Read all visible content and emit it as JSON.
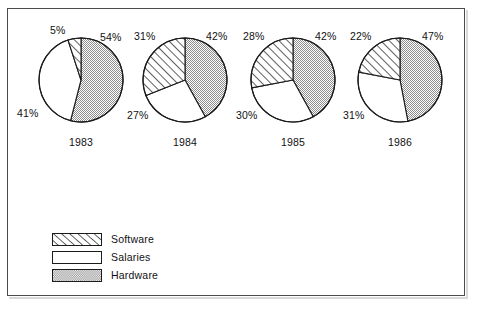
{
  "figure": {
    "background_color": "#ffffff",
    "frame_color": "#4a4a4a"
  },
  "legend": {
    "position": "bottom-left",
    "items": [
      {
        "label": "Software",
        "pattern": "diagonal-hatch",
        "swatch_name": "legend-swatch-software"
      },
      {
        "label": "Salaries",
        "pattern": "solid-white",
        "swatch_name": "legend-swatch-salaries"
      },
      {
        "label": "Hardware",
        "pattern": "stipple-gray",
        "swatch_name": "legend-swatch-hardware"
      }
    ]
  },
  "chart_data": {
    "type": "pie",
    "title": "",
    "subtitle": "",
    "xlabel": "",
    "ylabel": "",
    "legend_position": "bottom-left",
    "grid": false,
    "categories": [
      "Hardware",
      "Salaries",
      "Software"
    ],
    "category_colors": {
      "Hardware": "#c9c9c9",
      "Salaries": "#ffffff",
      "Software": "#ffffff"
    },
    "category_patterns": {
      "Hardware": "stipple-gray",
      "Salaries": "solid-white",
      "Software": "diagonal-hatch"
    },
    "start_angle_deg": 0,
    "direction": "clockwise",
    "value_unit": "%",
    "charts": [
      {
        "name": "pie-1983",
        "year": "1983",
        "cx": 81,
        "cy": 80,
        "r": 42,
        "slices": [
          {
            "category": "Hardware",
            "value": 54,
            "label": "54%",
            "label_x": 100,
            "label_y": 31
          },
          {
            "category": "Salaries",
            "value": 41,
            "label": "41%",
            "label_x": 17,
            "label_y": 107
          },
          {
            "category": "Software",
            "value": 5,
            "label": "5%",
            "label_x": 50,
            "label_y": 24
          }
        ]
      },
      {
        "name": "pie-1984",
        "year": "1984",
        "cx": 185,
        "cy": 80,
        "r": 42,
        "slices": [
          {
            "category": "Hardware",
            "value": 42,
            "label": "42%",
            "label_x": 206,
            "label_y": 30
          },
          {
            "category": "Salaries",
            "value": 27,
            "label": "27%",
            "label_x": 127,
            "label_y": 109
          },
          {
            "category": "Software",
            "value": 31,
            "label": "31%",
            "label_x": 134,
            "label_y": 30
          }
        ]
      },
      {
        "name": "pie-1985",
        "year": "1985",
        "cx": 293,
        "cy": 80,
        "r": 42,
        "slices": [
          {
            "category": "Hardware",
            "value": 42,
            "label": "42%",
            "label_x": 315,
            "label_y": 30
          },
          {
            "category": "Salaries",
            "value": 30,
            "label": "30%",
            "label_x": 236,
            "label_y": 109
          },
          {
            "category": "Software",
            "value": 28,
            "label": "28%",
            "label_x": 243,
            "label_y": 30
          }
        ]
      },
      {
        "name": "pie-1986",
        "year": "1986",
        "cx": 400,
        "cy": 80,
        "r": 42,
        "slices": [
          {
            "category": "Hardware",
            "value": 47,
            "label": "47%",
            "label_x": 422,
            "label_y": 30
          },
          {
            "category": "Salaries",
            "value": 31,
            "label": "31%",
            "label_x": 343,
            "label_y": 109
          },
          {
            "category": "Software",
            "value": 22,
            "label": "22%",
            "label_x": 350,
            "label_y": 30
          }
        ]
      }
    ],
    "year_labels": [
      {
        "text": "1983",
        "x": 81,
        "y": 136
      },
      {
        "text": "1984",
        "x": 185,
        "y": 136
      },
      {
        "text": "1985",
        "x": 293,
        "y": 136
      },
      {
        "text": "1986",
        "x": 400,
        "y": 136
      }
    ]
  }
}
